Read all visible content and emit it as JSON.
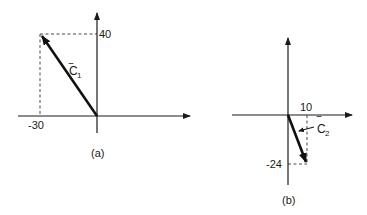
{
  "figure_a": {
    "caption": "(a)",
    "vector": {
      "name": "C",
      "subscript": "1",
      "bar": "‾",
      "x": -30,
      "y": 40
    },
    "x_label": "-30",
    "y_label": "40"
  },
  "figure_b": {
    "caption": "(b)",
    "vector": {
      "name": "C",
      "subscript": "2",
      "bar": "‾",
      "x": 10,
      "y": -24
    },
    "x_label": "10",
    "y_label": "-24"
  },
  "colors": {
    "ink": "#1a1a1a",
    "background": "#ffffff"
  }
}
